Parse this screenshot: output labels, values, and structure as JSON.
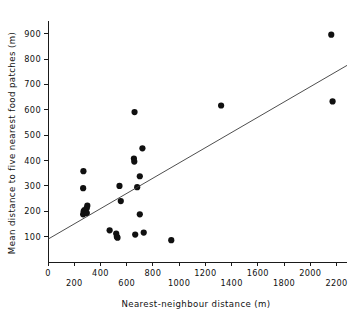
{
  "chart_data": {
    "type": "scatter",
    "title": "",
    "xlabel": "Nearest-neighbour  distance (m)",
    "ylabel": "Mean distance to five nearest food patches (m)",
    "xlim": [
      0,
      2280
    ],
    "ylim": [
      0,
      950
    ],
    "grid": false,
    "legend": null,
    "xticks": [
      0,
      200,
      400,
      600,
      800,
      1000,
      1200,
      1400,
      1600,
      1800,
      2000,
      2200
    ],
    "xticklabels": [
      "0",
      "200",
      "400",
      "600",
      "800",
      "1000",
      "1200",
      "1400",
      "1600",
      "1800",
      "2000",
      "2200"
    ],
    "xtick_label_stagger": true,
    "yticks": [
      100,
      200,
      300,
      400,
      500,
      600,
      700,
      800,
      900
    ],
    "yticklabels": [
      "100",
      "200",
      "300",
      "400",
      "500",
      "600",
      "700",
      "800",
      "900"
    ],
    "points": [
      {
        "x": 270,
        "y": 358
      },
      {
        "x": 268,
        "y": 291
      },
      {
        "x": 300,
        "y": 222
      },
      {
        "x": 295,
        "y": 212
      },
      {
        "x": 278,
        "y": 205
      },
      {
        "x": 272,
        "y": 200
      },
      {
        "x": 282,
        "y": 196
      },
      {
        "x": 268,
        "y": 188
      },
      {
        "x": 296,
        "y": 193
      },
      {
        "x": 470,
        "y": 125
      },
      {
        "x": 520,
        "y": 112
      },
      {
        "x": 525,
        "y": 100
      },
      {
        "x": 530,
        "y": 96
      },
      {
        "x": 545,
        "y": 300
      },
      {
        "x": 555,
        "y": 240
      },
      {
        "x": 660,
        "y": 591
      },
      {
        "x": 655,
        "y": 408
      },
      {
        "x": 658,
        "y": 396
      },
      {
        "x": 720,
        "y": 448
      },
      {
        "x": 700,
        "y": 338
      },
      {
        "x": 680,
        "y": 295
      },
      {
        "x": 700,
        "y": 188
      },
      {
        "x": 665,
        "y": 108
      },
      {
        "x": 730,
        "y": 116
      },
      {
        "x": 940,
        "y": 86
      },
      {
        "x": 1320,
        "y": 617
      },
      {
        "x": 2160,
        "y": 896
      },
      {
        "x": 2170,
        "y": 633
      }
    ],
    "fit_line": {
      "x_start": 0,
      "y_start": 90,
      "x_end": 2280,
      "y_end": 775
    },
    "marker": "filled-circle",
    "marker_color": "#101010"
  }
}
